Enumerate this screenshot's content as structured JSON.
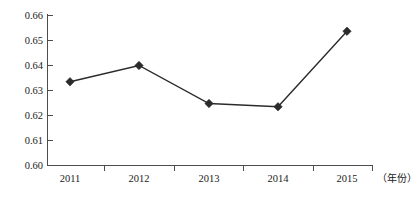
{
  "chart_data": {
    "type": "line",
    "title": "",
    "xlabel": "（年份）",
    "ylabel": "",
    "categories": [
      "2011",
      "2012",
      "2013",
      "2014",
      "2015"
    ],
    "values": [
      0.6335,
      0.64,
      0.6248,
      0.6235,
      0.6537
    ],
    "series": [
      {
        "name": "",
        "values": [
          0.6335,
          0.64,
          0.6248,
          0.6235,
          0.6537
        ]
      }
    ],
    "ylim": [
      0.6,
      0.66
    ],
    "yticks": [
      "0.60",
      "0.61",
      "0.62",
      "0.63",
      "0.64",
      "0.65",
      "0.66"
    ],
    "ytick_values": [
      0.6,
      0.61,
      0.62,
      0.63,
      0.64,
      0.65,
      0.66
    ],
    "xticks": [
      "2011",
      "2012",
      "2013",
      "2014",
      "2015"
    ],
    "grid": false,
    "legend": false,
    "legend_position": "none",
    "marker": "diamond",
    "line_color": "#2b2b2b",
    "marker_color": "#2b2b2b",
    "axis_color": "#4d4d4d",
    "background": "#ffffff"
  },
  "axis": {
    "y_labels": {
      "t0": "0.66",
      "t1": "0.65",
      "t2": "0.64",
      "t3": "0.63",
      "t4": "0.62",
      "t5": "0.61",
      "t6": "0.60"
    },
    "x_labels": {
      "c0": "2011",
      "c1": "2012",
      "c2": "2013",
      "c3": "2014",
      "c4": "2015"
    },
    "x_axis_title": "（年份）"
  }
}
